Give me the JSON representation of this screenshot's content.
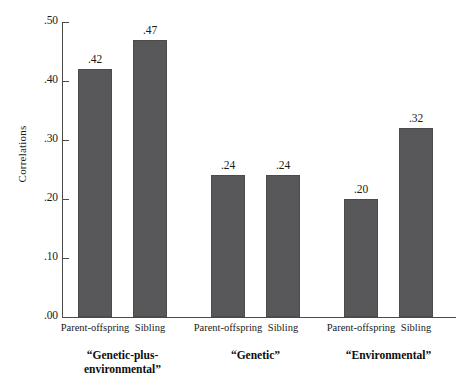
{
  "chart_data": {
    "type": "bar",
    "title": "",
    "subtitle": "",
    "xlabel": "",
    "ylabel": "Correlations",
    "ylim": [
      0.0,
      0.5
    ],
    "grid": false,
    "legend": null,
    "y_ticks": [
      ".00",
      ".10",
      ".20",
      ".30",
      ".40",
      ".50"
    ],
    "y_tick_values": [
      0.0,
      0.1,
      0.2,
      0.3,
      0.4,
      0.5
    ],
    "categories": [
      "Parent-offspring",
      "Sibling",
      "Parent-offspring",
      "Sibling",
      "Parent-offspring",
      "Sibling"
    ],
    "values": [
      0.42,
      0.47,
      0.24,
      0.24,
      0.2,
      0.32
    ],
    "value_labels": [
      ".42",
      ".47",
      ".24",
      ".24",
      ".20",
      ".32"
    ],
    "groups": [
      {
        "label": "“Genetic-plus-\nenvironmental”",
        "line1": "“Genetic-plus-",
        "line2": "environmental”",
        "bars": [
          0,
          1
        ]
      },
      {
        "label": "“Genetic”",
        "line1": "“Genetic”",
        "line2": "",
        "bars": [
          2,
          3
        ]
      },
      {
        "label": "“Environmental”",
        "line1": "“Environmental”",
        "line2": "",
        "bars": [
          4,
          5
        ]
      }
    ],
    "bar_color": "#58585a",
    "bar_edge_color": "#4b4b4d",
    "axis_color": "#4a4a4a",
    "background": "#ffffff"
  }
}
